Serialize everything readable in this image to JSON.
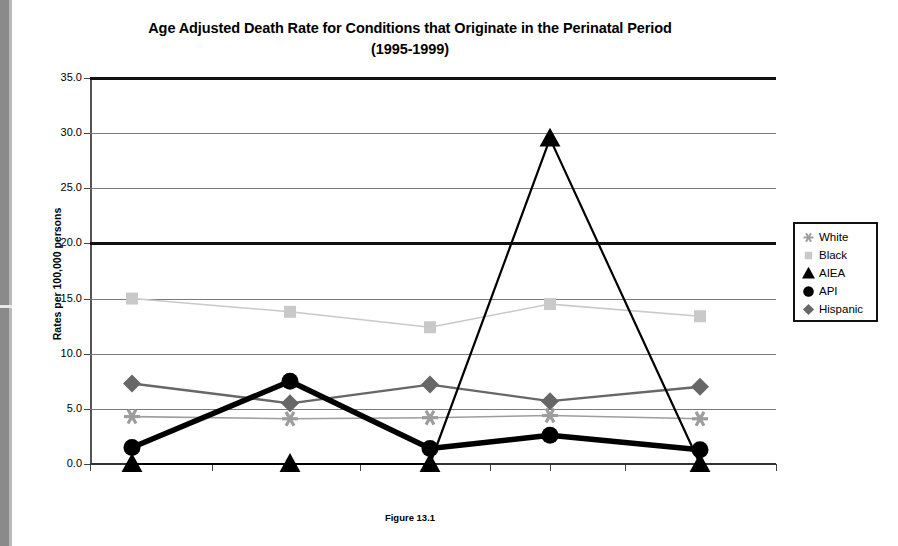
{
  "title": {
    "line1": "Age Adjusted Death Rate for Conditions that Originate in the Perinatal Period",
    "line2": "(1995-1999)"
  },
  "caption": "Figure 13.1",
  "axes": {
    "y_title": "Rates per 100,000 persons",
    "y_ticks": [
      "35.0",
      "30.0",
      "25.0",
      "20.0",
      "15.0",
      "10.0",
      "5.0",
      "0.0"
    ],
    "x_ticks": [
      "",
      "",
      "",
      "",
      "",
      "",
      "",
      "",
      "",
      "",
      ""
    ]
  },
  "legend": {
    "items": [
      {
        "label": "White",
        "marker": "star-marker",
        "color": "#9d9d9d"
      },
      {
        "label": "Black",
        "marker": "square-marker",
        "color": "#c9c9c9"
      },
      {
        "label": "AIEA",
        "marker": "triangle-marker",
        "color": "#000000"
      },
      {
        "label": "API",
        "marker": "circle-marker",
        "color": "#000000"
      },
      {
        "label": "Hispanic",
        "marker": "diamond-marker",
        "color": "#676767"
      }
    ]
  },
  "chart_data": {
    "type": "line",
    "title": "Age Adjusted Death Rate for Conditions that Originate in the Perinatal Period (1995-1999)",
    "xlabel": "",
    "ylabel": "Rates per 100,000 persons",
    "ylim": [
      0,
      35
    ],
    "ytick_step": 5,
    "grid": true,
    "legend_position": "right",
    "categories": [
      "1",
      "2",
      "3",
      "4",
      "5"
    ],
    "series": [
      {
        "name": "White",
        "color": "#9d9d9d",
        "marker": "star",
        "line_width": 1.6,
        "values": [
          4.3,
          4.1,
          4.2,
          4.4,
          4.1
        ]
      },
      {
        "name": "Black",
        "color": "#c9c9c9",
        "marker": "square",
        "line_width": 1.6,
        "values": [
          15.0,
          13.8,
          12.4,
          14.5,
          13.4
        ]
      },
      {
        "name": "AIEA",
        "color": "#000000",
        "marker": "triangle",
        "line_width": 2.2,
        "values": [
          0.0,
          0.0,
          0.0,
          29.5,
          0.0
        ]
      },
      {
        "name": "API",
        "color": "#000000",
        "marker": "circle",
        "line_width": 5.5,
        "values": [
          1.5,
          7.5,
          1.4,
          2.6,
          1.3
        ]
      },
      {
        "name": "Hispanic",
        "color": "#676767",
        "marker": "diamond",
        "line_width": 2.4,
        "values": [
          7.3,
          5.5,
          7.2,
          5.7,
          7.0
        ]
      }
    ]
  }
}
